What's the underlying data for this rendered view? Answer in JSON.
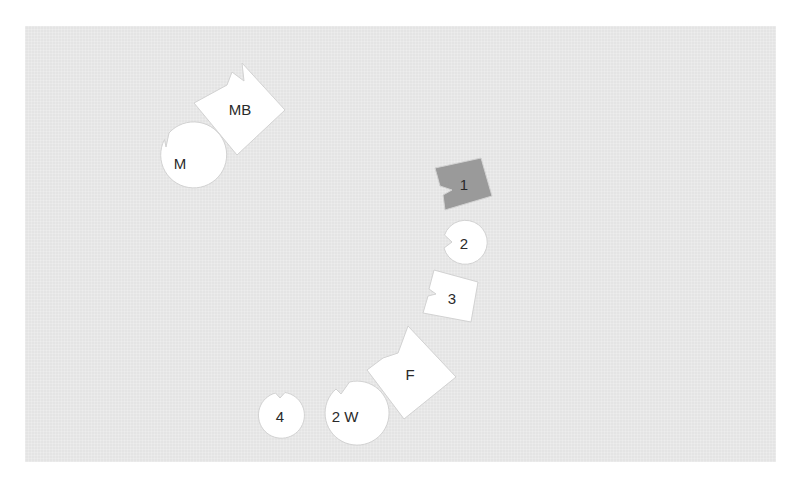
{
  "diagram": {
    "colors": {
      "background": "#e4e4e4",
      "piece_fill": "#ffffff",
      "highlight_fill": "#9a9a9a",
      "label": "#2a2a2a"
    },
    "pieces": [
      {
        "id": "MB",
        "label": "MB",
        "shape": "notched-square",
        "highlighted": false
      },
      {
        "id": "M",
        "label": "M",
        "shape": "notched-circle",
        "highlighted": false
      },
      {
        "id": "1",
        "label": "1",
        "shape": "notched-square",
        "highlighted": true
      },
      {
        "id": "2",
        "label": "2",
        "shape": "notched-circle",
        "highlighted": false
      },
      {
        "id": "3",
        "label": "3",
        "shape": "notched-square",
        "highlighted": false
      },
      {
        "id": "F",
        "label": "F",
        "shape": "notched-square",
        "highlighted": false
      },
      {
        "id": "2W",
        "label": "2 W",
        "shape": "notched-circle",
        "highlighted": false
      },
      {
        "id": "4",
        "label": "4",
        "shape": "notched-circle",
        "highlighted": false
      }
    ]
  }
}
